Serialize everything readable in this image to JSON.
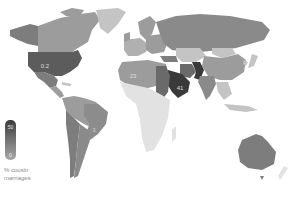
{
  "map": {
    "type": "choropleth-world",
    "labels": [
      {
        "region": "united-states",
        "value": "0.2",
        "x": 45,
        "y": 66
      },
      {
        "region": "north-africa",
        "value": "23",
        "x": 133,
        "y": 76
      },
      {
        "region": "saudi-arabia",
        "value": "41",
        "x": 180,
        "y": 88
      },
      {
        "region": "south-america",
        "value": "3",
        "x": 94,
        "y": 130
      }
    ],
    "colors": {
      "darkest": "#3a3a3a",
      "dark": "#5c5c5c",
      "medium": "#7d7d7d",
      "mediumLight": "#9c9c9c",
      "light": "#c4c4c4",
      "lightest": "#e2e2e2"
    }
  },
  "legend": {
    "max_label": "50",
    "min_label": "0",
    "caption_line1": "% cousin",
    "caption_line2": "marriages"
  }
}
